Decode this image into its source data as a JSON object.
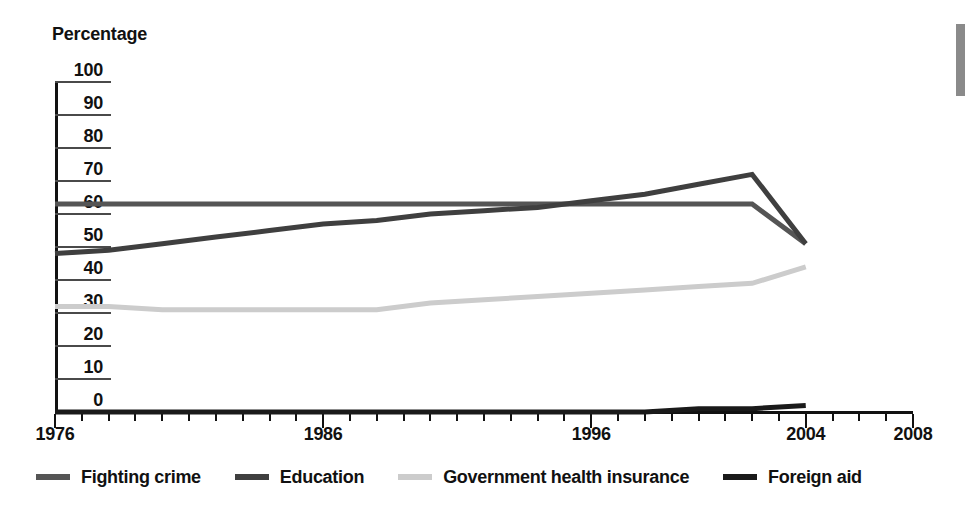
{
  "chart_data": {
    "type": "line",
    "title": "",
    "ylabel": "Percentage",
    "xlabel": "",
    "ylim": [
      0,
      100
    ],
    "ytick_step": 10,
    "yticks": [
      100,
      90,
      80,
      70,
      60,
      50,
      40,
      30,
      20,
      10,
      0
    ],
    "xlim": [
      1976,
      2008
    ],
    "xticks_labeled": [
      1976,
      1986,
      1996,
      2004,
      2008
    ],
    "xtick_step_minor": 1,
    "grid": false,
    "legend_position": "bottom",
    "x": [
      1976,
      1978,
      1980,
      1982,
      1984,
      1986,
      1988,
      1990,
      1992,
      1994,
      1996,
      1998,
      2000,
      2002,
      2004
    ],
    "series": [
      {
        "name": "Fighting crime",
        "color": "#555555",
        "values": [
          63,
          63,
          63,
          63,
          63,
          63,
          63,
          63,
          63,
          63,
          63,
          63,
          63,
          63,
          51
        ]
      },
      {
        "name": "Education",
        "color": "#3f3f3f",
        "values": [
          48,
          49,
          51,
          53,
          55,
          57,
          58,
          60,
          61,
          62,
          64,
          66,
          69,
          72,
          51
        ]
      },
      {
        "name": "Government health insurance",
        "color": "#cccccc",
        "values": [
          32,
          32,
          31,
          31,
          31,
          31,
          31,
          33,
          34,
          35,
          36,
          37,
          38,
          39,
          44
        ]
      },
      {
        "name": "Foreign aid",
        "color": "#1a1a1a",
        "values": [
          0,
          0,
          0,
          0,
          0,
          0,
          0,
          0,
          0,
          0,
          0,
          0,
          1,
          1,
          2
        ]
      }
    ]
  },
  "axis": {
    "ylabel_title": "Percentage",
    "ytick_labels": [
      "100",
      "90",
      "80",
      "70",
      "60",
      "50",
      "40",
      "30",
      "20",
      "10",
      "0"
    ],
    "xtick_labels": [
      "1976",
      "1986",
      "1996",
      "2004",
      "2008"
    ]
  },
  "legend": {
    "items": [
      {
        "label": "Fighting crime",
        "color": "#555555"
      },
      {
        "label": "Education",
        "color": "#3f3f3f"
      },
      {
        "label": "Government health insurance",
        "color": "#cccccc"
      },
      {
        "label": "Foreign aid",
        "color": "#1a1a1a"
      }
    ]
  }
}
